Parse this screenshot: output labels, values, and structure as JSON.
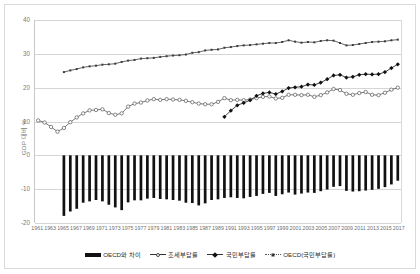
{
  "chart_data": {
    "type": "line",
    "title": "",
    "xlabel": "",
    "ylabel": "GDP 대비 %",
    "ylim": [
      -20,
      40
    ],
    "yticks": [
      40,
      30,
      20,
      10,
      0,
      -10,
      -20
    ],
    "grid": true,
    "legend_position": "bottom",
    "x": [
      1961,
      1962,
      1963,
      1964,
      1965,
      1966,
      1967,
      1968,
      1969,
      1970,
      1971,
      1972,
      1973,
      1974,
      1975,
      1976,
      1977,
      1978,
      1979,
      1980,
      1981,
      1982,
      1983,
      1984,
      1985,
      1986,
      1987,
      1988,
      1989,
      1990,
      1991,
      1992,
      1993,
      1994,
      1995,
      1996,
      1997,
      1998,
      1999,
      2000,
      2001,
      2002,
      2003,
      2004,
      2005,
      2006,
      2007,
      2008,
      2009,
      2010,
      2011,
      2012,
      2013,
      2014,
      2015,
      2016,
      2017
    ],
    "xtick_labels": [
      1961,
      1963,
      1965,
      1967,
      1969,
      1971,
      1973,
      1975,
      1977,
      1979,
      1981,
      1983,
      1985,
      1987,
      1989,
      1991,
      1993,
      1995,
      1997,
      1999,
      2001,
      2003,
      2005,
      2007,
      2009,
      2011,
      2013,
      2015,
      2017
    ],
    "series": [
      {
        "name": "OECD와 차이",
        "type": "bar",
        "color": "#111111",
        "values": [
          null,
          null,
          null,
          null,
          -17.9,
          -16.6,
          -15.8,
          -14.0,
          -13.6,
          -13.2,
          -13.6,
          -14.6,
          -15.4,
          -16.2,
          -13.9,
          -13.3,
          -13.3,
          -12.8,
          -12.6,
          -12.9,
          -13.0,
          -13.2,
          -13.4,
          -14.0,
          -14.1,
          -14.8,
          -14.2,
          -13.2,
          -13.0,
          -12.6,
          -12.4,
          -12.6,
          -12.7,
          -12.3,
          -12.0,
          -11.4,
          -11.1,
          -12.0,
          -11.5,
          -11.0,
          -11.6,
          -11.3,
          -11.0,
          -11.1,
          -10.6,
          -10.1,
          -9.3,
          -9.1,
          -10.5,
          -10.7,
          -10.6,
          -10.4,
          -10.2,
          -9.9,
          -9.4,
          -8.6,
          -7.5
        ]
      },
      {
        "name": "조세부담률",
        "type": "line",
        "marker": "open-circle",
        "color": "#555555",
        "values": [
          10.3,
          9.7,
          8.4,
          7.0,
          8.1,
          9.8,
          11.2,
          12.4,
          13.3,
          13.4,
          13.6,
          12.5,
          12.0,
          12.4,
          14.4,
          15.3,
          15.6,
          16.2,
          16.6,
          16.4,
          16.6,
          16.5,
          16.4,
          16.1,
          15.7,
          15.3,
          15.1,
          15.1,
          15.8,
          16.9,
          16.3,
          16.4,
          16.3,
          16.5,
          16.9,
          17.3,
          17.4,
          16.8,
          17.0,
          17.9,
          17.9,
          17.8,
          17.9,
          17.3,
          17.8,
          18.6,
          19.6,
          19.3,
          18.2,
          17.9,
          18.4,
          18.7,
          17.9,
          17.8,
          18.5,
          19.4,
          20.0
        ]
      },
      {
        "name": "국민부담률",
        "type": "line",
        "marker": "filled-diamond",
        "color": "#111111",
        "values": [
          null,
          null,
          null,
          null,
          null,
          null,
          null,
          null,
          null,
          null,
          null,
          null,
          null,
          null,
          null,
          null,
          null,
          null,
          null,
          null,
          null,
          null,
          null,
          null,
          null,
          null,
          null,
          null,
          null,
          11.4,
          13.2,
          14.8,
          15.5,
          16.3,
          17.6,
          18.3,
          18.6,
          18.1,
          18.9,
          19.9,
          20.1,
          20.3,
          20.9,
          20.8,
          21.5,
          22.5,
          23.6,
          23.8,
          23.0,
          23.2,
          23.8,
          24.0,
          23.9,
          24.0,
          24.6,
          25.8,
          26.9
        ]
      },
      {
        "name": "OECD(국민부담률)",
        "type": "line",
        "marker": "small-square",
        "color": "#3c3c3c",
        "values": [
          null,
          null,
          null,
          null,
          24.6,
          25.1,
          25.5,
          26.0,
          26.3,
          26.5,
          26.8,
          26.9,
          27.1,
          27.6,
          28.0,
          28.2,
          28.6,
          28.7,
          28.8,
          29.1,
          29.3,
          29.5,
          29.6,
          29.8,
          30.3,
          30.5,
          31.0,
          31.2,
          31.3,
          31.8,
          32.0,
          32.3,
          32.5,
          32.6,
          32.8,
          33.0,
          33.2,
          33.2,
          33.5,
          34.0,
          33.6,
          33.3,
          33.5,
          33.4,
          33.8,
          34.0,
          33.9,
          33.2,
          32.5,
          32.6,
          32.9,
          33.2,
          33.5,
          33.6,
          33.7,
          34.0,
          34.2
        ]
      }
    ]
  },
  "legend": {
    "items": [
      {
        "label": "OECD와 차이",
        "marker": "bar"
      },
      {
        "label": "조세부담률",
        "marker": "open-circle"
      },
      {
        "label": "국민부담률",
        "marker": "filled-diamond"
      },
      {
        "label": "OECD(국민부담률)",
        "marker": "small-square"
      }
    ]
  }
}
